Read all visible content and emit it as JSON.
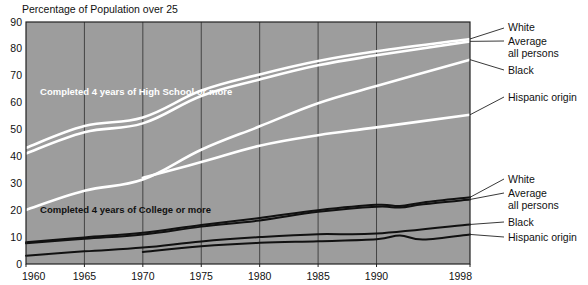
{
  "chart_data": {
    "type": "line",
    "title": "Percentage of Population over 25",
    "xlabel": "",
    "ylabel": "",
    "xlim": [
      1960,
      1998
    ],
    "ylim": [
      0,
      90
    ],
    "ytick_step": 10,
    "yticks": [
      "0",
      "10",
      "20",
      "30",
      "40",
      "50",
      "60",
      "70",
      "80",
      "90"
    ],
    "xticks": [
      "1960",
      "1965",
      "1970",
      "1975",
      "1980",
      "1985",
      "1990",
      "1998"
    ],
    "grid": "vertical-only",
    "legend_position": "right-inline",
    "plot_bg": "#9d9d9d",
    "annotations": [
      {
        "text": "Completed 4 years of High School or more",
        "color": "#ffffff",
        "x": 1961.2,
        "y": 63
      },
      {
        "text": "Completed 4 years of College or more",
        "color": "#111111",
        "x": 1961.2,
        "y": 19
      }
    ],
    "groups": [
      {
        "name": "Completed 4 years of High School or more",
        "color": "#ffffff",
        "series": [
          {
            "name": "White",
            "x": [
              1960,
              1965,
              1970,
              1975,
              1980,
              1985,
              1990,
              1998
            ],
            "values": [
              43.2,
              51.3,
              54.5,
              64.5,
              70.5,
              75.5,
              79.1,
              83.7
            ]
          },
          {
            "name": "Average all persons",
            "x": [
              1960,
              1965,
              1970,
              1975,
              1980,
              1985,
              1990,
              1998
            ],
            "values": [
              41.1,
              49.0,
              52.3,
              62.5,
              68.6,
              73.9,
              77.6,
              82.8
            ]
          },
          {
            "name": "Black",
            "x": [
              1960,
              1965,
              1970,
              1975,
              1980,
              1985,
              1990,
              1998
            ],
            "values": [
              20.1,
              27.2,
              31.4,
              42.5,
              51.2,
              59.8,
              66.2,
              76.0
            ]
          },
          {
            "name": "Hispanic origin",
            "x": [
              1970,
              1975,
              1980,
              1985,
              1990,
              1998
            ],
            "values": [
              32.1,
              37.9,
              44.0,
              47.9,
              50.8,
              55.5
            ]
          }
        ]
      },
      {
        "name": "Completed 4 years of College or more",
        "color": "#111111",
        "series": [
          {
            "name": "White",
            "x": [
              1960,
              1965,
              1970,
              1975,
              1980,
              1985,
              1990,
              1992,
              1994,
              1998
            ],
            "values": [
              8.1,
              9.9,
              11.6,
              14.5,
              17.1,
              20.0,
              22.0,
              21.6,
              22.9,
              24.8
            ]
          },
          {
            "name": "Average all persons",
            "x": [
              1960,
              1965,
              1970,
              1975,
              1980,
              1985,
              1990,
              1992,
              1994,
              1998
            ],
            "values": [
              7.7,
              9.4,
              11.0,
              13.9,
              16.2,
              19.4,
              21.3,
              21.0,
              22.2,
              24.0
            ]
          },
          {
            "name": "Black",
            "x": [
              1960,
              1965,
              1970,
              1975,
              1980,
              1985,
              1990,
              1998
            ],
            "values": [
              3.1,
              4.7,
              6.1,
              8.4,
              10.0,
              11.1,
              11.3,
              14.7
            ]
          },
          {
            "name": "Hispanic origin",
            "x": [
              1970,
              1975,
              1980,
              1985,
              1990,
              1992,
              1994,
              1998
            ],
            "values": [
              4.5,
              6.6,
              7.9,
              8.5,
              9.2,
              10.6,
              9.1,
              11.0
            ]
          }
        ]
      }
    ],
    "right_labels_top": [
      {
        "text": "White"
      },
      {
        "text": "Average"
      },
      {
        "text": "all persons"
      },
      {
        "text": "Black"
      },
      {
        "text": "Hispanic origin"
      }
    ],
    "right_labels_bottom": [
      {
        "text": "White"
      },
      {
        "text": "Average"
      },
      {
        "text": "all persons"
      },
      {
        "text": "Black"
      },
      {
        "text": "Hispanic origin"
      }
    ]
  }
}
